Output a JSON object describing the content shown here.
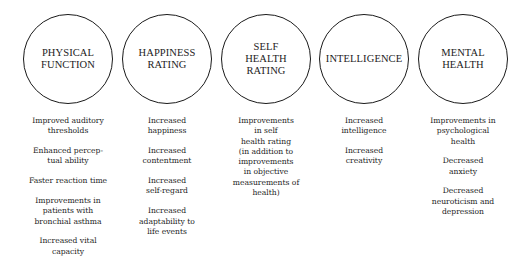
{
  "categories": [
    {
      "title_lines": [
        "PHYSICAL",
        "FUNCTION"
      ],
      "items": [
        "Improved auditory\nthresholds",
        "Enhanced percep-\ntual ability",
        "Faster reaction time",
        "Improvements in\npatients with\nbronchial asthma",
        "Increased vital\ncapacity"
      ]
    },
    {
      "title_lines": [
        "HAPPINESS",
        "RATING"
      ],
      "items": [
        "Increased\nhappiness",
        "Increased\ncontentment",
        "Increased\nself-regard",
        "Increased\nadaptability to\nlife events"
      ]
    },
    {
      "title_lines": [
        "SELF",
        "HEALTH",
        "RATING"
      ],
      "items": [
        "Improvements\nin self\nhealth rating\n(in addition to\nimprovements\nin objective\nmeasurements of\nhealth)"
      ]
    },
    {
      "title_lines": [
        "INTELLIGENCE"
      ],
      "items": [
        "Increased\nintelligence",
        "Increased\ncreativity"
      ]
    },
    {
      "title_lines": [
        "MENTAL",
        "HEALTH"
      ],
      "items": [
        "Improvements in\npsychological\nhealth",
        "Decreased\nanxiety",
        "Decreased\nneuroticism and\ndepression"
      ]
    }
  ]
}
